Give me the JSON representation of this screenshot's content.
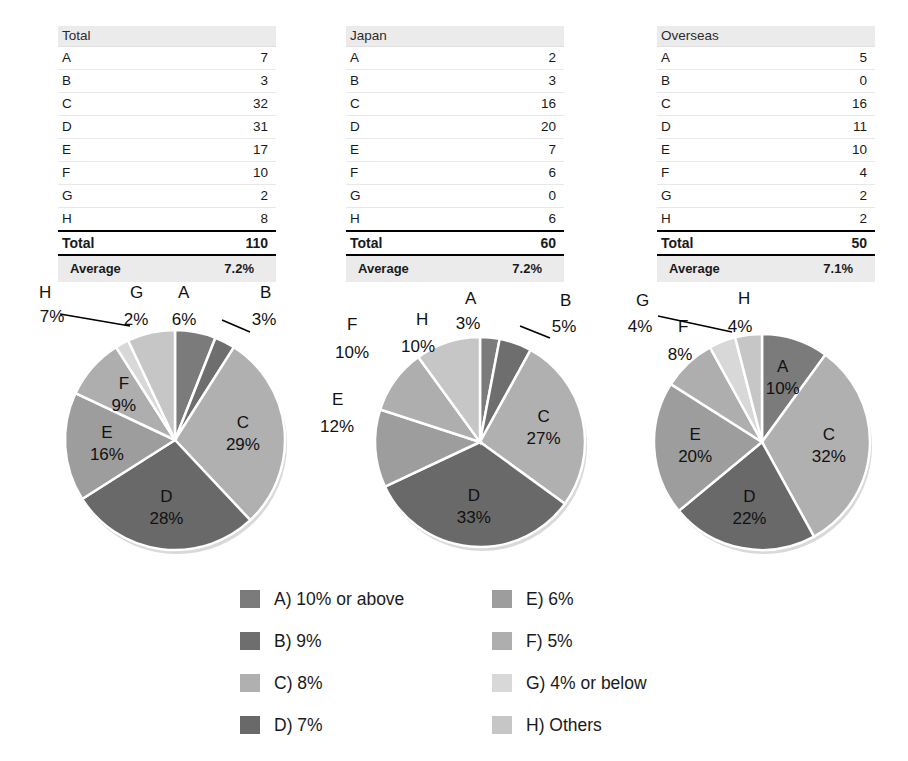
{
  "tables": [
    {
      "name": "total-table",
      "header": "Total",
      "header_value": "",
      "rows": [
        {
          "label": "A",
          "value": "7"
        },
        {
          "label": "B",
          "value": "3"
        },
        {
          "label": "C",
          "value": "32"
        },
        {
          "label": "D",
          "value": "31"
        },
        {
          "label": "E",
          "value": "17"
        },
        {
          "label": "F",
          "value": "10"
        },
        {
          "label": "G",
          "value": "2"
        },
        {
          "label": "H",
          "value": "8"
        }
      ],
      "total_label": "Total",
      "total_value": "110",
      "average_label": "Average",
      "average_value": "7.2%"
    },
    {
      "name": "japan-table",
      "header": "Japan",
      "header_value": "",
      "rows": [
        {
          "label": "A",
          "value": "2"
        },
        {
          "label": "B",
          "value": "3"
        },
        {
          "label": "C",
          "value": "16"
        },
        {
          "label": "D",
          "value": "20"
        },
        {
          "label": "E",
          "value": "7"
        },
        {
          "label": "F",
          "value": "6"
        },
        {
          "label": "G",
          "value": "0"
        },
        {
          "label": "H",
          "value": "6"
        }
      ],
      "total_label": "Total",
      "total_value": "60",
      "average_label": "Average",
      "average_value": "7.2%"
    },
    {
      "name": "overseas-table",
      "header": "Overseas",
      "header_value": "",
      "rows": [
        {
          "label": "A",
          "value": "5"
        },
        {
          "label": "B",
          "value": "0"
        },
        {
          "label": "C",
          "value": "16"
        },
        {
          "label": "D",
          "value": "11"
        },
        {
          "label": "E",
          "value": "10"
        },
        {
          "label": "F",
          "value": "4"
        },
        {
          "label": "G",
          "value": "2"
        },
        {
          "label": "H",
          "value": "2"
        }
      ],
      "total_label": "Total",
      "total_value": "50",
      "average_label": "Average",
      "average_value": "7.1%"
    }
  ],
  "colors": {
    "A": "#7b7b7b",
    "B": "#6e6e6e",
    "C": "#b0b0b0",
    "D": "#696969",
    "E": "#9d9d9d",
    "F": "#aeaeae",
    "G": "#d8d8d8",
    "H": "#c6c6c6"
  },
  "legend": {
    "columns": [
      [
        {
          "key": "A",
          "label": "A) 10% or above"
        },
        {
          "key": "B",
          "label": "B) 9%"
        },
        {
          "key": "C",
          "label": "C) 8%"
        },
        {
          "key": "D",
          "label": "D) 7%"
        }
      ],
      [
        {
          "key": "E",
          "label": "E) 6%"
        },
        {
          "key": "F",
          "label": "F) 5%"
        },
        {
          "key": "G",
          "label": "G) 4% or below"
        },
        {
          "key": "H",
          "label": "H) Others"
        }
      ]
    ]
  },
  "chart_data": [
    {
      "type": "pie",
      "name": "total-pie",
      "title": "Total",
      "categories": [
        "A",
        "B",
        "C",
        "D",
        "E",
        "F",
        "G",
        "H"
      ],
      "values": [
        6,
        3,
        29,
        28,
        16,
        9,
        2,
        7
      ],
      "labels": [
        "6%",
        "3%",
        "29%",
        "28%",
        "16%",
        "9%",
        "2%",
        "7%"
      ],
      "unit": "%",
      "start_angle": 0,
      "direction": "clockwise"
    },
    {
      "type": "pie",
      "name": "japan-pie",
      "title": "Japan",
      "categories": [
        "A",
        "B",
        "C",
        "D",
        "E",
        "F",
        "G",
        "H"
      ],
      "values": [
        3,
        5,
        27,
        33,
        12,
        10,
        0,
        10
      ],
      "labels": [
        "3%",
        "5%",
        "27%",
        "33%",
        "12%",
        "10%",
        "",
        "10%"
      ],
      "unit": "%",
      "start_angle": 0,
      "direction": "clockwise"
    },
    {
      "type": "pie",
      "name": "overseas-pie",
      "title": "Overseas",
      "categories": [
        "A",
        "B",
        "C",
        "D",
        "E",
        "F",
        "G",
        "H"
      ],
      "values": [
        10,
        0,
        32,
        22,
        20,
        8,
        4,
        4
      ],
      "labels": [
        "10%",
        "",
        "32%",
        "22%",
        "20%",
        "8%",
        "4%",
        "4%"
      ],
      "unit": "%",
      "start_angle": 0,
      "direction": "clockwise"
    }
  ]
}
